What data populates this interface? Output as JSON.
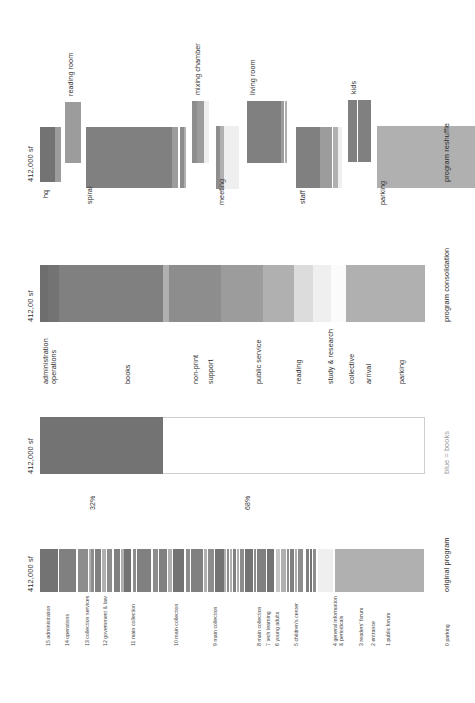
{
  "document": {
    "kind": "architectural program bar diagram",
    "orientation": "rotated-90-ccw",
    "background": "#ffffff"
  },
  "palette": {
    "darkest": "#6e6e6e",
    "dark": "#737373",
    "mid_dark": "#808080",
    "mid": "#8d8d8d",
    "mid_light": "#9c9c9c",
    "light": "#b0b0b0",
    "lighter": "#c6c6c6",
    "very_light": "#dcdcdc",
    "near_white": "#efefef",
    "white": "#fbfbfb",
    "frame": "#cfcfcf",
    "text": "#3a3a3a",
    "text_muted": "#9a9a9a"
  },
  "charts": [
    {
      "id": "original-program",
      "title": "original program",
      "total_label": "412,000 sf",
      "labels": [
        "15 administration",
        "14 operations",
        "13 collection services",
        "12 government & law",
        "11 main collection",
        "10 main collection",
        "9 main collection",
        "8 main collection",
        "7 tech learning",
        "6 young adults",
        "5 children's center",
        "4 general information\n& periodicals",
        "3 readers' forum",
        "2 entrance",
        "1 public forum",
        "0 parking"
      ]
    },
    {
      "id": "books-share",
      "title": "blue = books",
      "total_label": "412,000 sf",
      "filled_pct_label": "32%",
      "empty_pct_label": "68%",
      "filled_pct": 32,
      "empty_pct": 68
    },
    {
      "id": "program-consolidation",
      "title": "program consolidation",
      "total_label": "412,00 sf",
      "labels": [
        "administration",
        "operations",
        "books",
        "non-print",
        "support",
        "public service",
        "reading",
        "study & research",
        "collective",
        "arrival",
        "parking"
      ]
    },
    {
      "id": "program-reshuffle",
      "title": "program reshuffle",
      "total_label": "412,000 sf",
      "labels": [
        "hq",
        "reading room",
        "spiral",
        "mixing chamber",
        "meeting",
        "living room",
        "staff",
        "kids",
        "parking"
      ]
    }
  ],
  "chart_data": [
    {
      "type": "bar",
      "id": "original-program",
      "title": "original program",
      "subtitle": "412,000 sf",
      "orientation": "horizontal-stacked",
      "note": "single stacked bar of 412,000 sf broken into 16 labeled program areas, read right-to-left 15..0",
      "categories": [
        "15 administration",
        "14 operations",
        "13 collection services",
        "12 government & law",
        "11 main collection",
        "10 main collection",
        "9 main collection",
        "8 main collection",
        "7 tech learning",
        "6 young adults",
        "5 children's center",
        "4 general information & periodicals",
        "3 readers' forum",
        "2 entrance",
        "1 public forum",
        "0 parking"
      ],
      "values_pct": [
        5.0,
        4.3,
        3.0,
        5.5,
        9.0,
        8.0,
        9.2,
        7.0,
        2.0,
        3.2,
        5.5,
        6.0,
        3.0,
        1.5,
        4.0,
        23.8
      ],
      "xlabel": "",
      "ylabel": "",
      "grid": false,
      "legend": false
    },
    {
      "type": "bar",
      "id": "books-share",
      "title": "blue = books",
      "subtitle": "412,000 sf",
      "orientation": "horizontal-stacked",
      "categories": [
        "books",
        "everything else"
      ],
      "values_pct": [
        32,
        68
      ],
      "data_labels": [
        "32%",
        "68%"
      ],
      "xlabel": "",
      "ylabel": "",
      "grid": false,
      "legend": false
    },
    {
      "type": "bar",
      "id": "program-consolidation",
      "title": "program consolidation",
      "subtitle": "412,00 sf",
      "orientation": "horizontal-stacked",
      "categories": [
        "administration",
        "operations",
        "books",
        "non-print",
        "support",
        "public service",
        "reading",
        "study & research",
        "collective",
        "arrival",
        "parking"
      ],
      "values_pct": [
        2.0,
        3.0,
        27.0,
        1.5,
        13.5,
        11.0,
        8.0,
        5.0,
        4.5,
        4.0,
        20.5
      ],
      "xlabel": "",
      "ylabel": "",
      "grid": false,
      "legend": false
    },
    {
      "type": "bar",
      "id": "program-reshuffle",
      "title": "program reshuffle",
      "subtitle": "412,000 sf",
      "orientation": "horizontal-grouped-blocks",
      "note": "same 412,000 sf regrouped into 9 stacked volumes of differing depth",
      "categories": [
        "hq",
        "reading room",
        "spiral",
        "mixing chamber",
        "meeting",
        "living room",
        "staff",
        "kids",
        "parking"
      ],
      "values_pct": [
        5.5,
        4.0,
        26.0,
        4.5,
        6.0,
        10.5,
        12.0,
        6.0,
        25.5
      ],
      "xlabel": "",
      "ylabel": "",
      "grid": false,
      "legend": false
    }
  ]
}
